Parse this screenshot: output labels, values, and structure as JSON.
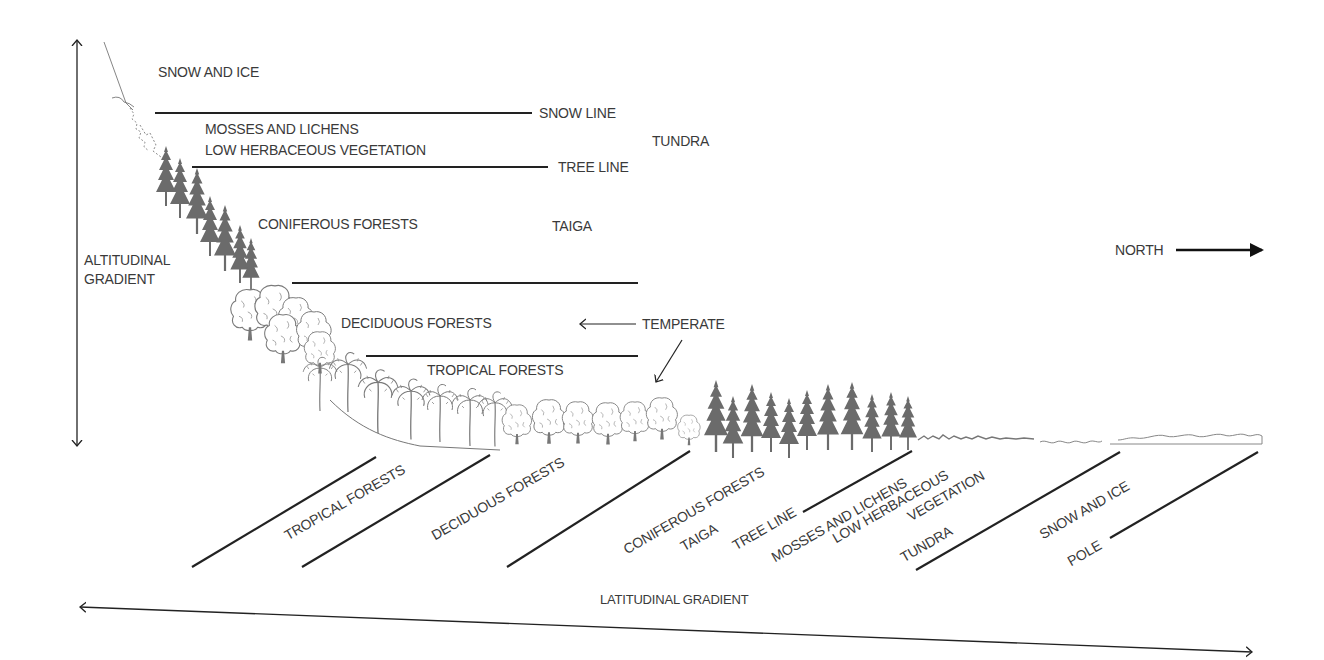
{
  "diagram": {
    "type": "vegetation-zones-altitude-vs-latitude",
    "axes": {
      "vertical": "ALTITUDINAL GRADIENT",
      "horizontal": "LATITUDINAL GRADIENT",
      "direction": "NORTH"
    },
    "altitude_zones": {
      "snow_ice": "SNOW AND ICE",
      "snow_line": "SNOW LINE",
      "mosses": "MOSSES AND LICHENS",
      "low_herb": "LOW HERBACEOUS VEGETATION",
      "tundra": "TUNDRA",
      "tree_line": "TREE LINE",
      "coniferous": "CONIFEROUS FORESTS",
      "taiga": "TAIGA",
      "deciduous": "DECIDUOUS FORESTS",
      "temperate": "TEMPERATE",
      "tropical": "TROPICAL FORESTS"
    },
    "latitude_zones": {
      "tropical": "TROPICAL FORESTS",
      "deciduous": "DECIDUOUS FORESTS",
      "coniferous": "CONIFEROUS FORESTS",
      "taiga": "TAIGA",
      "tree_line": "TREE LINE",
      "mosses": "MOSSES AND LICHENS",
      "low_herb": "LOW HERBACEOUS",
      "vegetation": "VEGETATION",
      "tundra": "TUNDRA",
      "snow_ice": "SNOW AND ICE",
      "pole": "POLE"
    },
    "colors": {
      "line": "#222222",
      "text": "#3a3a3a",
      "conifer": "#6b6b6b",
      "deciduous_outline": "#7a7a7a"
    }
  }
}
